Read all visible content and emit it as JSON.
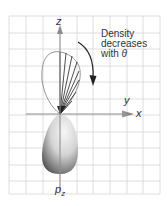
{
  "diagram": {
    "axes": {
      "z_label": "z",
      "y_label": "y",
      "x_label": "x"
    },
    "annotation": {
      "line1": "Density",
      "line2": "decreases",
      "line3_prefix": "with ",
      "line3_symbol": "θ"
    },
    "orbital_label": {
      "main": "p",
      "subscript": "z"
    },
    "colors": {
      "grid": "#d6d6d6",
      "axis": "#8c8c8c",
      "outline": "#8a8a8a",
      "rays": "#222222",
      "arrow": "#222222",
      "lobe_light": "#f4f4f4",
      "lobe_dark": "#4a4a4a"
    }
  }
}
